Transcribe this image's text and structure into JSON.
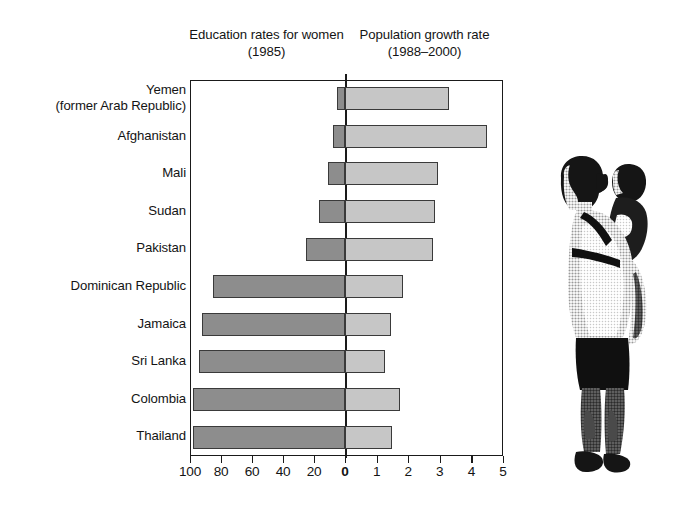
{
  "headings": {
    "left": "Education rates for\nwomen (1985)",
    "right": "Population growth\nrate (1988–2000)"
  },
  "axis": {
    "left_ticks": [
      "100",
      "80",
      "60",
      "40",
      "20"
    ],
    "zero": "0",
    "right_ticks": [
      "1",
      "2",
      "3",
      "4",
      "5"
    ]
  },
  "illustration": {
    "name": "woman-carrying-child-photo",
    "description": "Halftone photograph of a woman standing with a young child carried on her back in a sling"
  },
  "colors": {
    "education_bar": "#8d8d8d",
    "population_bar": "#c6c6c6",
    "outline": "#3a3a3a",
    "axis": "#1a1a1a",
    "background": "#ffffff"
  },
  "chart_data": {
    "type": "bar",
    "title": "",
    "orientation": "horizontal",
    "layout": "diverging back-to-back bars about a shared zero line",
    "categories": [
      "Yemen\n(former Arab Republic)",
      "Afghanistan",
      "Mali",
      "Sudan",
      "Pakistan",
      "Dominican Republic",
      "Jamaica",
      "Sri Lanka",
      "Colombia",
      "Thailand"
    ],
    "series": [
      {
        "name": "Education rates for women (1985)",
        "unit": "percent",
        "direction": "left",
        "axis_label": "Education rates for women (1985)",
        "axis_ticks": [
          100,
          80,
          60,
          40,
          20,
          0
        ],
        "axis_range": [
          100,
          0
        ],
        "values": [
          5,
          8,
          11,
          17,
          25,
          85,
          92,
          94,
          98,
          98
        ]
      },
      {
        "name": "Population growth rate (1988–2000)",
        "unit": "percent per year",
        "direction": "right",
        "axis_label": "Population growth rate (1988–2000)",
        "axis_ticks": [
          0,
          1,
          2,
          3,
          4,
          5
        ],
        "axis_range": [
          0,
          5
        ],
        "values": [
          3.3,
          4.5,
          2.95,
          2.85,
          2.8,
          1.85,
          1.45,
          1.25,
          1.75,
          1.5
        ]
      }
    ],
    "xlabel": "",
    "ylabel": "",
    "grid": false,
    "legend": "none"
  }
}
